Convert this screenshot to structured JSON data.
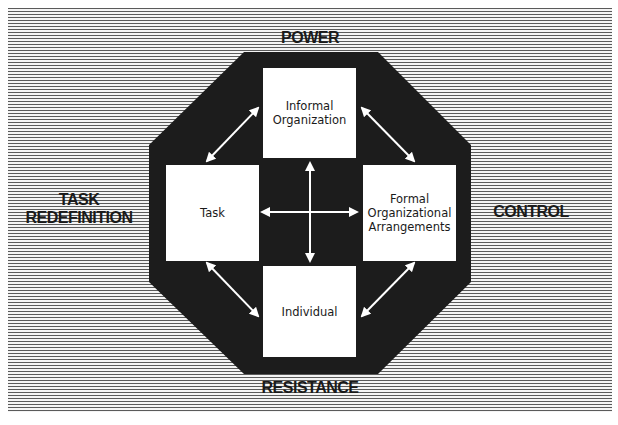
{
  "diagram": {
    "outer_labels": {
      "top": "POWER",
      "bottom": "RESISTANCE",
      "left_line1": "TASK",
      "left_line2": "REDEFINITION",
      "right": "CONTROL"
    },
    "boxes": {
      "top": {
        "line1": "Informal",
        "line2": "Organization"
      },
      "left": {
        "line1": "Task"
      },
      "right": {
        "line1": "Formal",
        "line2": "Organizational",
        "line3": "Arrangements"
      },
      "bottom": {
        "line1": "Individual"
      }
    },
    "connections": [
      {
        "from": "Task",
        "to": "Informal Organization",
        "type": "bidirectional"
      },
      {
        "from": "Informal Organization",
        "to": "Formal Organizational Arrangements",
        "type": "bidirectional"
      },
      {
        "from": "Task",
        "to": "Individual",
        "type": "bidirectional"
      },
      {
        "from": "Individual",
        "to": "Formal Organizational Arrangements",
        "type": "bidirectional"
      },
      {
        "from": "Task",
        "to": "Formal Organizational Arrangements",
        "type": "bidirectional"
      },
      {
        "from": "Informal Organization",
        "to": "Individual",
        "type": "bidirectional"
      }
    ],
    "colors": {
      "octagon": "#1c1c1c",
      "box": "#ffffff",
      "stripe_dark": "#5a5a5a",
      "stripe_light": "#f4f4f4",
      "arrow": "#ffffff"
    }
  }
}
